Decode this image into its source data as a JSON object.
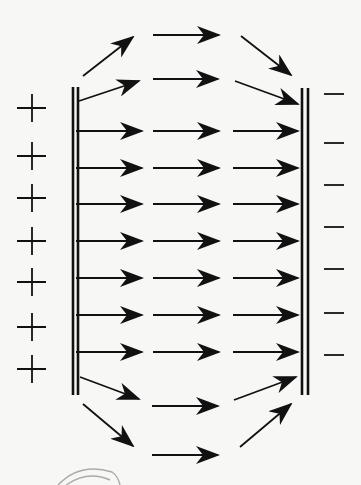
{
  "colors": {
    "background": "#f7f7f5",
    "ink": "#111111",
    "sketch": "#8a8a8a"
  },
  "left_plate": {
    "charge_sign": "+",
    "x_lines": [
      73,
      78
    ],
    "y_top": 87,
    "y_bottom": 395,
    "charges_y": [
      108,
      156,
      198,
      241,
      282,
      327,
      369
    ],
    "charge_x_center": 32
  },
  "right_plate": {
    "charge_sign": "−",
    "x_lines": [
      302,
      308
    ],
    "y_top": 88,
    "y_bottom": 395,
    "charges_y": [
      94,
      143,
      185,
      227,
      269,
      313,
      355
    ],
    "charge_x_range": [
      324,
      344
    ]
  },
  "field_arrows": [
    {
      "row": "top-outer",
      "segments": [
        [
          83,
          76,
          133,
          37
        ],
        [
          153,
          35,
          219,
          35
        ],
        [
          241,
          36,
          291,
          75
        ]
      ]
    },
    {
      "row": "top-inner",
      "segments": [
        [
          79,
          101,
          139,
          81
        ],
        [
          153,
          79,
          218,
          79
        ],
        [
          235,
          81,
          298,
          104
        ]
      ]
    },
    {
      "row": "uniform-1",
      "segments": [
        [
          76,
          131,
          142,
          131
        ],
        [
          153,
          131,
          219,
          131
        ],
        [
          233,
          131,
          298,
          131
        ]
      ]
    },
    {
      "row": "uniform-2",
      "segments": [
        [
          76,
          168,
          142,
          168
        ],
        [
          153,
          168,
          219,
          168
        ],
        [
          233,
          168,
          298,
          168
        ]
      ]
    },
    {
      "row": "uniform-3",
      "segments": [
        [
          76,
          204,
          142,
          204
        ],
        [
          153,
          204,
          219,
          204
        ],
        [
          233,
          204,
          298,
          204
        ]
      ]
    },
    {
      "row": "uniform-4",
      "segments": [
        [
          76,
          241,
          142,
          241
        ],
        [
          153,
          241,
          219,
          241
        ],
        [
          233,
          241,
          298,
          241
        ]
      ]
    },
    {
      "row": "uniform-5",
      "segments": [
        [
          76,
          278,
          142,
          278
        ],
        [
          153,
          278,
          219,
          278
        ],
        [
          233,
          278,
          298,
          278
        ]
      ]
    },
    {
      "row": "uniform-6",
      "segments": [
        [
          76,
          315,
          142,
          315
        ],
        [
          153,
          315,
          219,
          315
        ],
        [
          233,
          315,
          298,
          315
        ]
      ]
    },
    {
      "row": "uniform-7",
      "segments": [
        [
          76,
          352,
          142,
          352
        ],
        [
          153,
          352,
          219,
          352
        ],
        [
          233,
          352,
          298,
          352
        ]
      ]
    },
    {
      "row": "bottom-inner",
      "segments": [
        [
          80,
          377,
          139,
          399
        ],
        [
          152,
          406,
          218,
          406
        ],
        [
          234,
          400,
          296,
          377
        ]
      ]
    },
    {
      "row": "bottom-outer",
      "segments": [
        [
          83,
          404,
          133,
          446
        ],
        [
          152,
          455,
          218,
          455
        ],
        [
          240,
          447,
          291,
          404
        ]
      ]
    }
  ],
  "sketch_curve": {
    "paths": [
      "M58 485 Q 80 462 112 472 Q 118 476 120 485",
      "M66 485 Q 88 470 110 480"
    ]
  }
}
